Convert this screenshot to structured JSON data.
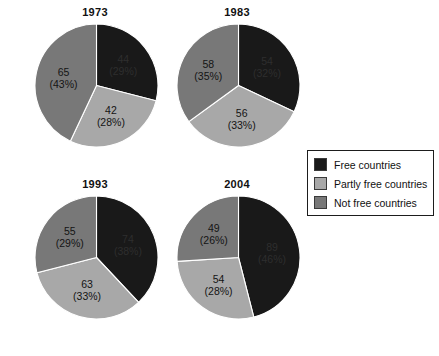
{
  "chart_data": {
    "type": "pie",
    "title": "",
    "legend_position": "right-middle",
    "categories": [
      "Free countries",
      "Partly free countries",
      "Not free countries"
    ],
    "colors": {
      "free": "#191919",
      "partly_free": "#a8a8a8",
      "not_free": "#787878"
    },
    "charts": [
      {
        "title": "1973",
        "slices": [
          {
            "category": "Free countries",
            "value": 44,
            "percent": 29,
            "label_value": "44",
            "label_percent": "(29%)"
          },
          {
            "category": "Partly free countries",
            "value": 42,
            "percent": 28,
            "label_value": "42",
            "label_percent": "(28%)"
          },
          {
            "category": "Not free countries",
            "value": 65,
            "percent": 43,
            "label_value": "65",
            "label_percent": "(43%)"
          }
        ]
      },
      {
        "title": "1983",
        "slices": [
          {
            "category": "Free countries",
            "value": 54,
            "percent": 32,
            "label_value": "54",
            "label_percent": "(32%)"
          },
          {
            "category": "Partly free countries",
            "value": 56,
            "percent": 33,
            "label_value": "56",
            "label_percent": "(33%)"
          },
          {
            "category": "Not free countries",
            "value": 58,
            "percent": 35,
            "label_value": "58",
            "label_percent": "(35%)"
          }
        ]
      },
      {
        "title": "1993",
        "slices": [
          {
            "category": "Free countries",
            "value": 74,
            "percent": 38,
            "label_value": "74",
            "label_percent": "(38%)"
          },
          {
            "category": "Partly free countries",
            "value": 63,
            "percent": 33,
            "label_value": "63",
            "label_percent": "(33%)"
          },
          {
            "category": "Not free countries",
            "value": 55,
            "percent": 29,
            "label_value": "55",
            "label_percent": "(29%)"
          }
        ]
      },
      {
        "title": "2004",
        "slices": [
          {
            "category": "Free countries",
            "value": 89,
            "percent": 46,
            "label_value": "89",
            "label_percent": "(46%)"
          },
          {
            "category": "Partly free countries",
            "value": 54,
            "percent": 28,
            "label_value": "54",
            "label_percent": "(28%)"
          },
          {
            "category": "Not free countries",
            "value": 49,
            "percent": 26,
            "label_value": "49",
            "label_percent": "(26%)"
          }
        ]
      }
    ]
  },
  "legend": {
    "items": [
      {
        "label": "Free countries",
        "color": "#191919"
      },
      {
        "label": "Partly free countries",
        "color": "#a8a8a8"
      },
      {
        "label": "Not free countries",
        "color": "#787878"
      }
    ]
  }
}
